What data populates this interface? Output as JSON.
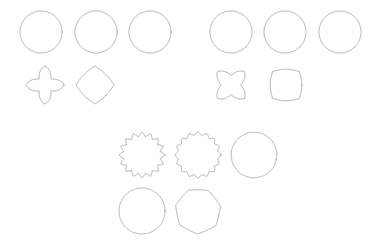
{
  "page": {
    "background_color": "#ffffff",
    "width": 376,
    "height": 241
  },
  "style": {
    "stroke_color": "#9a9a9a",
    "stroke_width": 0.8,
    "fill": "none"
  },
  "shapes": [
    {
      "name": "cross-sharp",
      "label": "Cross (sharp corners)",
      "kind": "superellipse-cross",
      "center": [
        41,
        32
      ],
      "radius": 21,
      "arm_width": 0.34,
      "roundness": 0.02,
      "rotation": 0,
      "points": 4,
      "row": 1,
      "column": 1
    },
    {
      "name": "cross-slightly-rounded",
      "label": "Cross (slightly rounded)",
      "kind": "superellipse-cross",
      "center": [
        96,
        32
      ],
      "radius": 21,
      "arm_width": 0.36,
      "roundness": 0.16,
      "rotation": 0,
      "points": 4,
      "row": 1,
      "column": 2
    },
    {
      "name": "cross-rounded",
      "label": "Cross (rounded lobes)",
      "kind": "superellipse-cross",
      "center": [
        150,
        32
      ],
      "radius": 21,
      "arm_width": 0.38,
      "roundness": 0.42,
      "rotation": 0,
      "points": 4,
      "row": 1,
      "column": 3
    },
    {
      "name": "cross-x-sharp",
      "label": "X cross (sharp corners)",
      "kind": "superellipse-cross",
      "center": [
        231,
        32
      ],
      "radius": 21,
      "arm_width": 0.34,
      "roundness": 0.04,
      "rotation": 45,
      "points": 4,
      "row": 1,
      "column": 4
    },
    {
      "name": "cross-x-slightly-rounded",
      "label": "X cross (slightly rounded)",
      "kind": "superellipse-cross",
      "center": [
        285,
        32
      ],
      "radius": 21,
      "arm_width": 0.36,
      "roundness": 0.18,
      "rotation": 45,
      "points": 4,
      "row": 1,
      "column": 5
    },
    {
      "name": "cross-x-rounded",
      "label": "X cross (rounded lobes)",
      "kind": "superellipse-cross",
      "center": [
        340,
        32
      ],
      "radius": 21,
      "arm_width": 0.4,
      "roundness": 0.44,
      "rotation": 45,
      "points": 4,
      "row": 1,
      "column": 6
    },
    {
      "name": "four-point-star",
      "label": "Four pointed star",
      "kind": "star",
      "center": [
        45,
        85
      ],
      "radius": 19,
      "inner_ratio": 0.44,
      "roundness": 0.3,
      "rotation": 0,
      "points": 4,
      "row": 2,
      "column": 1
    },
    {
      "name": "rounded-diamond",
      "label": "Rounded diamond",
      "kind": "rounded-polygon",
      "center": [
        95,
        85
      ],
      "radius": 19,
      "roundness": 0.3,
      "rotation": 45,
      "points": 4,
      "row": 2,
      "column": 2
    },
    {
      "name": "four-point-star-rotated",
      "label": "Four pointed star (rotated)",
      "kind": "star",
      "center": [
        231,
        85
      ],
      "radius": 19,
      "inner_ratio": 0.5,
      "roundness": 0.24,
      "rotation": 45,
      "points": 4,
      "row": 2,
      "column": 3
    },
    {
      "name": "rounded-square",
      "label": "Rounded square",
      "kind": "rounded-polygon",
      "center": [
        286,
        85
      ],
      "radius": 19,
      "roundness": 0.42,
      "rotation": 0,
      "points": 4,
      "row": 2,
      "column": 4
    },
    {
      "name": "spiked-star-sixteen",
      "label": "Spiked star (sixteen points)",
      "kind": "star",
      "center": [
        142,
        155
      ],
      "radius": 23,
      "inner_ratio": 0.8,
      "roundness": 0.02,
      "rotation": 0,
      "points": 16,
      "row": 3,
      "column": 1
    },
    {
      "name": "wavy-star-sixteen",
      "label": "Wavy star (sixteen points)",
      "kind": "star",
      "center": [
        198,
        155
      ],
      "radius": 23,
      "inner_ratio": 0.87,
      "roundness": 0.5,
      "rotation": 0,
      "points": 16,
      "row": 3,
      "column": 2
    },
    {
      "name": "rounded-nonagon",
      "label": "Rounded nonagon",
      "kind": "rounded-polygon",
      "center": [
        254,
        155
      ],
      "radius": 23,
      "roundness": 0.62,
      "rotation": 12,
      "points": 11,
      "row": 3,
      "column": 3
    },
    {
      "name": "circle",
      "label": "Circle",
      "kind": "rounded-polygon",
      "center": [
        142,
        211
      ],
      "radius": 23,
      "roundness": 1.0,
      "rotation": 0,
      "points": 24,
      "row": 4,
      "column": 1
    },
    {
      "name": "rounded-heptagon",
      "label": "Rounded heptagon",
      "kind": "rounded-polygon",
      "center": [
        198,
        211
      ],
      "radius": 23,
      "roundness": 0.22,
      "rotation": 14,
      "points": 7,
      "row": 4,
      "column": 2
    }
  ]
}
